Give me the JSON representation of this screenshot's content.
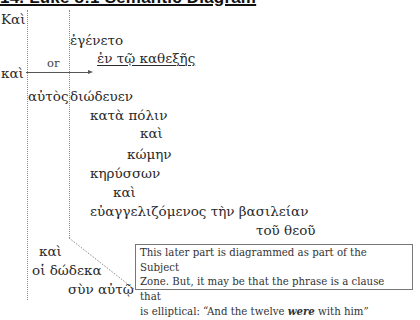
{
  "title": "14. Luke 8:1 Semantic Diagram",
  "diagram": {
    "words": [
      {
        "id": "kai_1",
        "text": "Καὶ"
      },
      {
        "id": "egeneto",
        "text": "ἐγένετο"
      },
      {
        "id": "en_to_kathexes",
        "text": "ἐν τῷ καθεξῆς"
      },
      {
        "id": "kai_2",
        "text": "καὶ"
      },
      {
        "id": "or",
        "text": "or"
      },
      {
        "id": "autos",
        "text": "αὐτὸς"
      },
      {
        "id": "diodeuen",
        "text": "διώδευεν"
      },
      {
        "id": "kata_polin",
        "text": "κατὰ πόλιν"
      },
      {
        "id": "kai_3",
        "text": "καὶ"
      },
      {
        "id": "komen",
        "text": "κώμην"
      },
      {
        "id": "kerysson",
        "text": "κηρύσσων"
      },
      {
        "id": "kai_4",
        "text": "καὶ"
      },
      {
        "id": "euangelizomenos",
        "text": "εὐαγγελιζόμενος τὴν βασιλείαν"
      },
      {
        "id": "tou_theou",
        "text": "τοῦ θεοῦ"
      },
      {
        "id": "kai_5",
        "text": "καὶ"
      },
      {
        "id": "hoi_dodeka",
        "text": "οἱ δώδεκα"
      },
      {
        "id": "syn_auto",
        "text": "σὺν αὐτῷ"
      }
    ],
    "note": {
      "line1": "This later part is diagrammed as part of the Subject",
      "line2": "Zone. But, it may be that the phrase is a clause that",
      "line3_prefix": "is elliptical: “And the twelve ",
      "line3_emphasis": "were",
      "line3_suffix": " with him”"
    }
  },
  "colors": {
    "text": "#2a2a2a",
    "dotted_lines": "#8a8a8a",
    "arrow": "#555555",
    "note_border": "#777777"
  }
}
